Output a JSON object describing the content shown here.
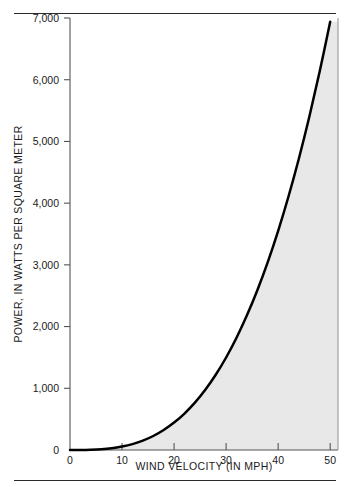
{
  "figure": {
    "background_color": "#ffffff",
    "rule_color": "#2b2b2b",
    "top_rule_name": "top-divider-rule",
    "bottom_rule_name": "bottom-divider-rule"
  },
  "chart_data": {
    "type": "line",
    "title": "",
    "subtitle": "",
    "xlabel": "WIND VELOCITY (IN MPH)",
    "ylabel": "POWER, IN WATTS PER SQUARE METER",
    "xlim": [
      0,
      51.5
    ],
    "ylim": [
      0,
      7000
    ],
    "xticks": [
      0,
      10,
      20,
      30,
      40,
      50
    ],
    "xtick_labels": [
      "0",
      "10",
      "20",
      "30",
      "40",
      "50"
    ],
    "yticks": [
      0,
      1000,
      2000,
      3000,
      4000,
      5000,
      6000,
      7000
    ],
    "ytick_labels": [
      "0",
      "1,000",
      "2,000",
      "3,000",
      "4,000",
      "5,000",
      "6,000",
      "7,000"
    ],
    "grid": false,
    "legend": null,
    "legend_position": "none",
    "line_color": "#000000",
    "line_width": 2.5,
    "fill_color": "#e8e8e8",
    "fill_below": true,
    "relationship": "power proportional to cube of wind velocity",
    "x": [
      0,
      2,
      4,
      6,
      8,
      10,
      12,
      14,
      16,
      18,
      20,
      22,
      24,
      26,
      28,
      30,
      32,
      34,
      36,
      38,
      40,
      42,
      44,
      46,
      48,
      50
    ],
    "values": [
      0,
      0,
      4,
      12,
      28,
      56,
      96,
      152,
      227,
      324,
      444,
      591,
      767,
      976,
      1219,
      1499,
      1819,
      2182,
      2589,
      3045,
      3552,
      4112,
      4728,
      5403,
      6140,
      6938
    ],
    "series": [
      {
        "name": "Wind power density",
        "values": [
          0,
          0,
          4,
          12,
          28,
          56,
          96,
          152,
          227,
          324,
          444,
          591,
          767,
          976,
          1219,
          1499,
          1819,
          2182,
          2589,
          3045,
          3552,
          4112,
          4728,
          5403,
          6140,
          6938
        ]
      }
    ],
    "annotations": []
  },
  "plot_geometry": {
    "left": 70,
    "right": 338,
    "top": 18,
    "bottom": 450
  }
}
